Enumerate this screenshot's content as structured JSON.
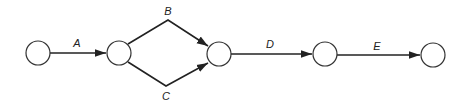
{
  "diagram": {
    "type": "activity-on-arrow network",
    "nodes": [
      {
        "id": "n1",
        "cx": 38,
        "cy": 53,
        "r": 12
      },
      {
        "id": "n2",
        "cx": 119,
        "cy": 53,
        "r": 12
      },
      {
        "id": "n3",
        "cx": 219,
        "cy": 54,
        "r": 12
      },
      {
        "id": "n4",
        "cx": 325,
        "cy": 54,
        "r": 12
      },
      {
        "id": "n5",
        "cx": 433,
        "cy": 55,
        "r": 12
      }
    ],
    "edges": [
      {
        "label": "A",
        "from": "n1",
        "to": "n2"
      },
      {
        "label": "B",
        "from": "n2",
        "to": "n3"
      },
      {
        "label": "C",
        "from": "n2",
        "to": "n3"
      },
      {
        "label": "D",
        "from": "n3",
        "to": "n4"
      },
      {
        "label": "E",
        "from": "n4",
        "to": "n5"
      }
    ],
    "labels": {
      "a": "A",
      "b": "B",
      "c": "C",
      "d": "D",
      "e": "E"
    }
  }
}
